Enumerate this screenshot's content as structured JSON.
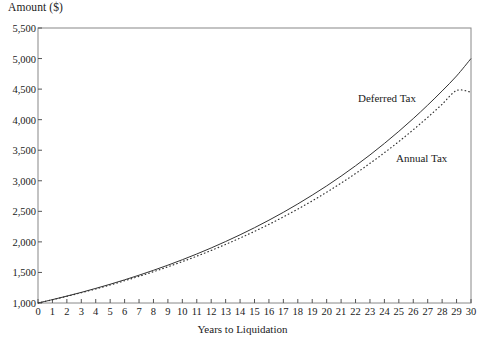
{
  "chart_data": {
    "type": "line",
    "title": "",
    "ylabel": "Amount ($)",
    "xlabel": "Years to Liquidation",
    "xlim": [
      0,
      30
    ],
    "ylim": [
      1000,
      5500
    ],
    "grid": false,
    "legend_position": "inline-on-curves",
    "x_ticks": [
      "0",
      "1",
      "2",
      "3",
      "4",
      "5",
      "6",
      "7",
      "8",
      "9",
      "10",
      "11",
      "12",
      "13",
      "14",
      "15",
      "16",
      "17",
      "18",
      "19",
      "20",
      "21",
      "22",
      "23",
      "24",
      "25",
      "26",
      "27",
      "28",
      "29",
      "30"
    ],
    "y_ticks": [
      "1,000",
      "1,500",
      "2,000",
      "2,500",
      "3,000",
      "3,500",
      "4,000",
      "4,500",
      "5,000",
      "5,500"
    ],
    "y_tick_values": [
      1000,
      1500,
      2000,
      2500,
      3000,
      3500,
      4000,
      4500,
      5000,
      5500
    ],
    "x": [
      0,
      1,
      2,
      3,
      4,
      5,
      6,
      7,
      8,
      9,
      10,
      11,
      12,
      13,
      14,
      15,
      16,
      17,
      18,
      19,
      20,
      21,
      22,
      23,
      24,
      25,
      26,
      27,
      28,
      29,
      30
    ],
    "series": [
      {
        "name": "Deferred Tax",
        "style": "solid",
        "color": "#333333",
        "values": [
          1000,
          1055,
          1113,
          1174,
          1239,
          1307,
          1379,
          1455,
          1535,
          1619,
          1708,
          1802,
          1901,
          2006,
          2116,
          2232,
          2355,
          2484,
          2621,
          2765,
          2916,
          3076,
          3245,
          3423,
          3611,
          3809,
          4018,
          4238,
          4470,
          4715,
          5000
        ]
      },
      {
        "name": "Annual Tax",
        "style": "dotted",
        "color": "#333333",
        "values": [
          1000,
          1053,
          1109,
          1168,
          1230,
          1295,
          1364,
          1436,
          1512,
          1592,
          1677,
          1766,
          1860,
          1959,
          2063,
          2172,
          2287,
          2409,
          2537,
          2671,
          2813,
          2962,
          3119,
          3285,
          3459,
          3642,
          3835,
          4038,
          4252,
          4477,
          4450
        ]
      }
    ],
    "annotations": [
      {
        "text": "Deferred Tax",
        "near_series": "Deferred Tax"
      },
      {
        "text": "Annual Tax",
        "near_series": "Annual Tax"
      }
    ]
  },
  "colors": {
    "axis": "#555555",
    "frame": "#888888",
    "line": "#333333",
    "text": "#1a1a1a",
    "background": "#ffffff"
  }
}
